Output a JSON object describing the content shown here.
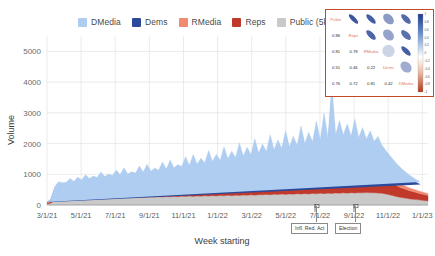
{
  "chart_data": {
    "type": "area",
    "title": "",
    "xlabel": "Week starting",
    "ylabel": "Volume",
    "stacked": true,
    "grid": true,
    "legend_position": "top",
    "ylim": [
      0,
      5500
    ],
    "yticks": [
      0,
      1000,
      2000,
      3000,
      4000,
      5000
    ],
    "ytick_labels": [
      "0",
      "1000",
      "2000",
      "3000",
      "4000",
      "5000"
    ],
    "xticks": [
      "3/1/21",
      "5/1/21",
      "7/1/21",
      "9/1/21",
      "11/1/21",
      "1/1/22",
      "3/1/22",
      "5/1/22",
      "7/1/22",
      "9/1/22",
      "11/1/22",
      "1/1/23"
    ],
    "series": [
      {
        "name": "Public (5k)",
        "color": "#c9c9c9",
        "values": [
          40,
          60,
          150,
          190,
          205,
          200,
          215,
          225,
          210,
          230,
          220,
          235,
          225,
          240,
          230,
          245,
          235,
          250,
          240,
          255,
          245,
          250,
          240,
          255,
          250,
          260,
          255,
          265,
          255,
          270,
          260,
          275,
          265,
          280,
          270,
          285,
          275,
          290,
          280,
          295,
          285,
          300,
          290,
          305,
          295,
          310,
          300,
          315,
          305,
          320,
          310,
          325,
          315,
          330,
          320,
          335,
          330,
          345,
          335,
          350,
          340,
          355,
          345,
          360,
          350,
          365,
          355,
          370,
          360,
          375,
          365,
          380,
          370,
          385,
          375,
          390,
          380,
          395,
          385,
          400,
          390,
          400,
          395,
          405,
          395,
          400,
          390,
          380,
          360,
          330,
          300,
          270,
          245,
          225,
          205,
          190,
          175,
          160,
          145,
          130
        ]
      },
      {
        "name": "Reps",
        "color": "#c0392b",
        "values": [
          25,
          45,
          120,
          150,
          165,
          140,
          180,
          160,
          195,
          170,
          210,
          185,
          225,
          195,
          240,
          205,
          230,
          215,
          250,
          220,
          265,
          230,
          245,
          240,
          275,
          250,
          285,
          255,
          270,
          265,
          300,
          275,
          310,
          285,
          295,
          300,
          330,
          310,
          345,
          320,
          360,
          330,
          375,
          340,
          390,
          350,
          405,
          360,
          420,
          370,
          435,
          380,
          450,
          395,
          465,
          405,
          480,
          415,
          495,
          430,
          510,
          440,
          525,
          450,
          540,
          465,
          555,
          475,
          570,
          485,
          590,
          500,
          610,
          515,
          630,
          530,
          650,
          545,
          670,
          560,
          640,
          545,
          620,
          530,
          600,
          515,
          560,
          490,
          455,
          420,
          385,
          350,
          320,
          295,
          270,
          250,
          230,
          210,
          195,
          180
        ]
      },
      {
        "name": "RMedia",
        "color": "#f08b72",
        "values": [
          8,
          15,
          35,
          45,
          40,
          38,
          50,
          42,
          55,
          46,
          60,
          50,
          65,
          52,
          70,
          56,
          66,
          60,
          72,
          62,
          78,
          66,
          70,
          68,
          80,
          70,
          84,
          72,
          78,
          74,
          88,
          78,
          92,
          82,
          86,
          86,
          96,
          90,
          100,
          94,
          106,
          98,
          112,
          102,
          118,
          106,
          124,
          110,
          130,
          114,
          136,
          118,
          142,
          124,
          150,
          128,
          158,
          134,
          166,
          140,
          174,
          146,
          182,
          152,
          190,
          158,
          198,
          164,
          206,
          170,
          214,
          178,
          222,
          186,
          230,
          194,
          238,
          202,
          246,
          210,
          232,
          200,
          220,
          192,
          210,
          184,
          196,
          172,
          158,
          144,
          130,
          118,
          108,
          98,
          90,
          82,
          76,
          70,
          64,
          58
        ]
      },
      {
        "name": "Dems",
        "color": "#2b4a9b",
        "values": [
          18,
          60,
          230,
          300,
          250,
          290,
          330,
          270,
          360,
          290,
          400,
          310,
          340,
          320,
          430,
          330,
          380,
          345,
          460,
          355,
          500,
          365,
          420,
          375,
          530,
          385,
          560,
          395,
          480,
          405,
          600,
          420,
          640,
          435,
          530,
          450,
          700,
          470,
          740,
          485,
          620,
          500,
          800,
          520,
          680,
          535,
          860,
          555,
          720,
          570,
          920,
          590,
          780,
          610,
          980,
          630,
          820,
          650,
          1040,
          670,
          880,
          690,
          1100,
          710,
          930,
          730,
          1180,
          760,
          990,
          780,
          1260,
          810,
          1460,
          840,
          2290,
          900,
          1180,
          870,
          1060,
          820,
          1240,
          800,
          1020,
          780,
          960,
          740,
          860,
          700,
          620,
          560,
          500,
          450,
          400,
          360,
          320,
          285,
          255,
          230
        ]
      },
      {
        "name": "DMedia",
        "color": "#aecdf0",
        "values": [
          6,
          18,
          60,
          75,
          65,
          72,
          84,
          70,
          90,
          76,
          98,
          82,
          88,
          84,
          106,
          88,
          96,
          92,
          114,
          96,
          124,
          100,
          106,
          104,
          132,
          108,
          140,
          112,
          120,
          116,
          150,
          120,
          158,
          126,
          134,
          130,
          172,
          136,
          180,
          142,
          152,
          146,
          196,
          152,
          166,
          158,
          210,
          164,
          176,
          170,
          224,
          178,
          190,
          184,
          238,
          192,
          200,
          198,
          252,
          206,
          214,
          212,
          266,
          220,
          226,
          228,
          284,
          238,
          242,
          246,
          302,
          256,
          330,
          264,
          420,
          276,
          300,
          270,
          282,
          258,
          292,
          250,
          268,
          242,
          250,
          232,
          226,
          210,
          190,
          172,
          156,
          142,
          128,
          116,
          105,
          95,
          86,
          78,
          70,
          62
        ]
      }
    ]
  },
  "legend": {
    "items": [
      {
        "label": "DMedia",
        "color": "#aecdf0"
      },
      {
        "label": "Dems",
        "color": "#2b4a9b"
      },
      {
        "label": "RMedia",
        "color": "#f08b72"
      },
      {
        "label": "Reps",
        "color": "#c0392b"
      },
      {
        "label": "Public (5k)",
        "color": "#c9c9c9"
      }
    ]
  },
  "annotations": [
    {
      "label": "Infl. Red. Act",
      "x_value": "8/16/22"
    },
    {
      "label": "Election",
      "x_value": "11/8/22"
    }
  ],
  "inset": {
    "type": "correlation-ellipse-matrix",
    "variables": [
      "Public",
      "Reps",
      "RMedia",
      "Dems",
      "DMedia"
    ],
    "label_color": "#e07a5f",
    "matrix": [
      [
        null,
        null,
        null,
        null,
        null
      ],
      [
        "0.86",
        null,
        null,
        null,
        null
      ],
      [
        "0.81",
        "0.78",
        null,
        null,
        null
      ],
      [
        "0.51",
        "0.46",
        "0.22",
        null,
        null
      ],
      [
        "0.76",
        "0.72",
        "0.81",
        "0.42",
        null
      ]
    ],
    "colorbar": {
      "ticks": [
        "1",
        "0.8",
        "0.6",
        "0.4",
        "0.2",
        "0",
        "-0.2",
        "-0.4",
        "-0.6",
        "-0.8",
        "-1"
      ],
      "high_color": "#1b3a8f",
      "mid_color": "#ffffff",
      "low_color": "#b03a1a"
    }
  }
}
